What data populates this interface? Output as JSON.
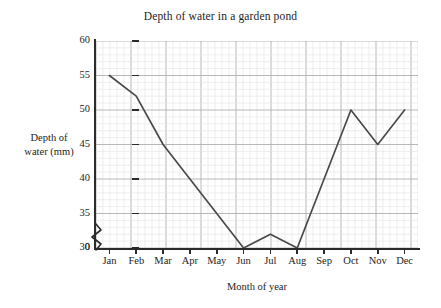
{
  "chart_data": {
    "type": "line",
    "title": "Depth of water in a garden pond",
    "xlabel": "Month of year",
    "ylabel": "Depth of water (mm)",
    "categories": [
      "Jan",
      "Feb",
      "Mar",
      "Apr",
      "May",
      "Jun",
      "Jul",
      "Aug",
      "Sep",
      "Oct",
      "Nov",
      "Dec"
    ],
    "values": [
      55,
      52,
      45,
      40,
      35,
      30,
      32,
      30,
      40,
      50,
      45,
      50
    ],
    "series": [
      {
        "name": "Depth of water",
        "values": [
          55,
          52,
          45,
          40,
          35,
          30,
          32,
          30,
          40,
          50,
          45,
          50
        ]
      }
    ],
    "ylim": [
      30,
      60
    ],
    "y_ticks": [
      "0",
      "30",
      "35",
      "40",
      "45",
      "50",
      "55",
      "60"
    ],
    "y_tick_values": [
      0,
      30,
      35,
      40,
      45,
      50,
      55,
      60
    ],
    "y_axis_break": true,
    "y_axis_break_between": [
      0,
      30
    ],
    "grid": true,
    "grid_minor": true,
    "grid_major_every": 5,
    "legend": "none",
    "line_color": "#4a4a4a",
    "grid_minor_color": "#e3e3e3",
    "grid_major_color": "#b0b0b0",
    "axis_color": "#2b2b2b",
    "background": "#ffffff"
  },
  "axis": {
    "y_title_line1": "Depth of",
    "y_title_line2": "water (mm)"
  }
}
